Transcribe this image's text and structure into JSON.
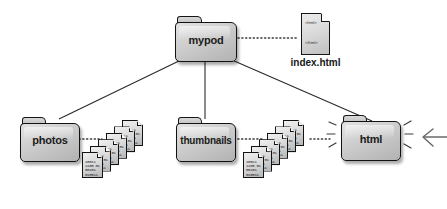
{
  "diagram": {
    "background_color": "#ffffff",
    "line_color": "#2a2a2a",
    "folder_fill": "#cfcfcf",
    "folder_stroke": "#121212"
  },
  "nodes": {
    "root_folder": {
      "label": "mypod",
      "type": "folder"
    },
    "index_file": {
      "label": "index.html",
      "type": "document",
      "code_top": "<html>",
      "code_bottom": "</html>"
    },
    "photos_folder": {
      "label": "photos",
      "type": "folder"
    },
    "thumbnails_folder": {
      "label": "thumbnails",
      "type": "folder"
    },
    "html_folder": {
      "label": "html",
      "type": "folder",
      "highlighted": true
    }
  },
  "stacks": {
    "photos_files": {
      "name": "photo-files-stack",
      "count": 6,
      "bit_rows": [
        "10011",
        "1100 01",
        "00101",
        "010011"
      ]
    },
    "thumbnail_files": {
      "name": "thumbnail-files-stack",
      "count": 6,
      "bit_rows": [
        "10011",
        "1100 01",
        "00101",
        "010011"
      ]
    }
  },
  "connectors": {
    "tree_edges": [
      {
        "from": "mypod",
        "to": "photos",
        "style": "solid"
      },
      {
        "from": "mypod",
        "to": "thumbnails",
        "style": "solid"
      },
      {
        "from": "mypod",
        "to": "html",
        "style": "solid"
      }
    ],
    "content_links": [
      {
        "from": "mypod",
        "to": "index.html",
        "style": "dotted"
      },
      {
        "from": "photos",
        "to": "photo-files-stack",
        "style": "dotted"
      },
      {
        "from": "thumbnails",
        "to": "thumbnail-files-stack",
        "style": "dotted"
      },
      {
        "from": "thumbnail-files-stack",
        "to": "html",
        "style": "dotted"
      }
    ]
  },
  "annotations": {
    "pointer_arrow": {
      "name": "left-pointing-arrow",
      "direction": "left"
    },
    "emphasis_marks": {
      "name": "highlight-sparkles",
      "target": "html"
    }
  }
}
